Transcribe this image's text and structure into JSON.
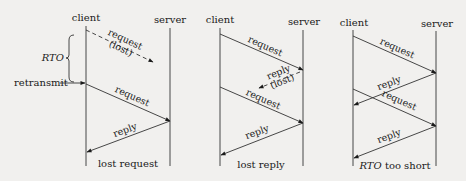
{
  "colors": {
    "background": "#f1f0ee",
    "ink": "#1a1a1a",
    "line": "#333333"
  },
  "panels": [
    {
      "client_label": "client",
      "server_label": "server",
      "caption": "lost request",
      "messages": [
        {
          "label": "request",
          "label2": "(lost)",
          "direction": "client-to-server",
          "style": "dashed",
          "lost": true
        },
        {
          "label": "request",
          "direction": "client-to-server",
          "style": "solid"
        },
        {
          "label": "reply",
          "direction": "server-to-client",
          "style": "solid"
        }
      ],
      "annotations": {
        "rto": "RTO",
        "retransmit": "retransmit"
      }
    },
    {
      "client_label": "client",
      "server_label": "server",
      "caption": "lost reply",
      "messages": [
        {
          "label": "request",
          "direction": "client-to-server",
          "style": "solid"
        },
        {
          "label": "reply",
          "label2": "(lost)",
          "direction": "server-to-client",
          "style": "dashed",
          "lost": true
        },
        {
          "label": "request",
          "direction": "client-to-server",
          "style": "solid"
        },
        {
          "label": "reply",
          "direction": "server-to-client",
          "style": "solid"
        }
      ]
    },
    {
      "client_label": "client",
      "server_label": "server",
      "caption_italic": "RTO",
      "caption_rest": " too short",
      "messages": [
        {
          "label": "request",
          "direction": "client-to-server",
          "style": "solid"
        },
        {
          "label": "reply",
          "direction": "server-to-client",
          "style": "solid"
        },
        {
          "label": "request",
          "direction": "client-to-server",
          "style": "solid"
        },
        {
          "label": "reply",
          "direction": "server-to-client",
          "style": "solid"
        }
      ]
    }
  ]
}
